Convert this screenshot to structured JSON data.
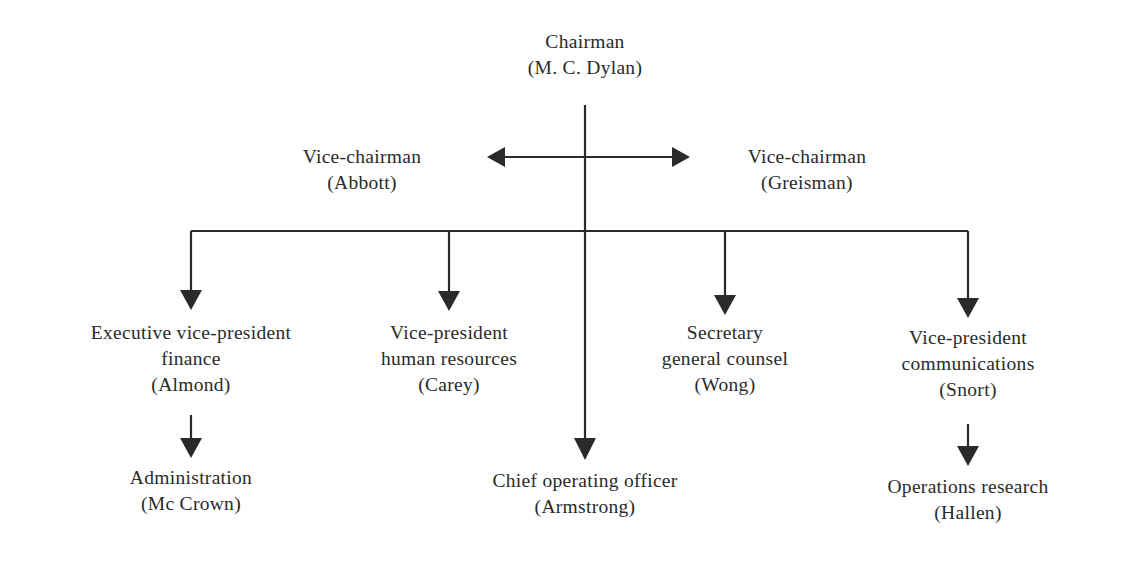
{
  "chart": {
    "type": "org-chart",
    "nodes": [
      {
        "id": "chairman",
        "title": [
          "Chairman"
        ],
        "name": "(M. C. Dylan)"
      },
      {
        "id": "vice-chairman-left",
        "title": [
          "Vice-chairman"
        ],
        "name": "(Abbott)"
      },
      {
        "id": "vice-chairman-right",
        "title": [
          "Vice-chairman"
        ],
        "name": "(Greisman)"
      },
      {
        "id": "evp-finance",
        "title": [
          "Executive vice-president",
          "finance"
        ],
        "name": "(Almond)"
      },
      {
        "id": "vp-hr",
        "title": [
          "Vice-president",
          "human resources"
        ],
        "name": "(Carey)"
      },
      {
        "id": "coo",
        "title": [
          "Chief operating officer"
        ],
        "name": "(Armstrong)"
      },
      {
        "id": "secretary",
        "title": [
          "Secretary",
          "general counsel"
        ],
        "name": "(Wong)"
      },
      {
        "id": "vp-communications",
        "title": [
          "Vice-president",
          "communications"
        ],
        "name": "(Snort)"
      },
      {
        "id": "administration",
        "title": [
          "Administration"
        ],
        "name": "(Mc Crown)"
      },
      {
        "id": "operations-research",
        "title": [
          "Operations research"
        ],
        "name": "(Hallen)"
      }
    ],
    "edges": [
      {
        "from": "chairman",
        "to": "vice-chairman-left"
      },
      {
        "from": "chairman",
        "to": "vice-chairman-right"
      },
      {
        "from": "chairman",
        "to": "evp-finance"
      },
      {
        "from": "chairman",
        "to": "vp-hr"
      },
      {
        "from": "chairman",
        "to": "coo"
      },
      {
        "from": "chairman",
        "to": "secretary"
      },
      {
        "from": "chairman",
        "to": "vp-communications"
      },
      {
        "from": "evp-finance",
        "to": "administration"
      },
      {
        "from": "vp-communications",
        "to": "operations-research"
      }
    ]
  },
  "colors": {
    "line": "#2a2a2a",
    "text": "#2a2a2a",
    "background": "#ffffff"
  }
}
